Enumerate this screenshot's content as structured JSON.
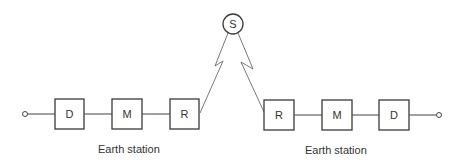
{
  "satellite": {
    "label": "S"
  },
  "left_station": {
    "label": "Earth station",
    "blocks": [
      {
        "id": "D",
        "label": "D"
      },
      {
        "id": "M",
        "label": "M"
      },
      {
        "id": "R",
        "label": "R"
      }
    ]
  },
  "right_station": {
    "label": "Earth station",
    "blocks": [
      {
        "id": "R",
        "label": "R"
      },
      {
        "id": "M",
        "label": "M"
      },
      {
        "id": "D",
        "label": "D"
      }
    ]
  },
  "colors": {
    "line": "#555555",
    "box_border": "#3a3a3a",
    "text": "#333333",
    "background": "#ffffff"
  }
}
